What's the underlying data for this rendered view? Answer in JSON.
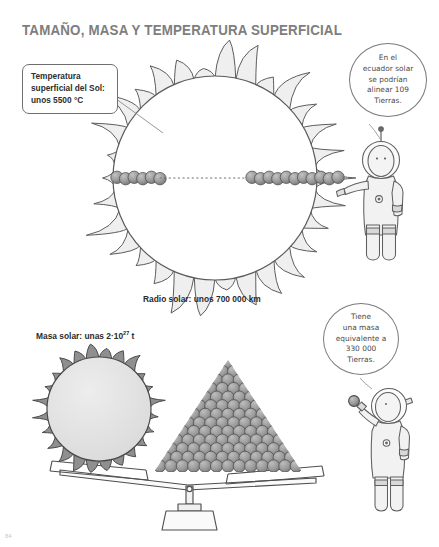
{
  "page": {
    "title": "TAMAÑO, MASA Y TEMPERATURA SUPERFICIAL",
    "page_number": "84",
    "background": "#ffffff",
    "ink": "#4a4a4a"
  },
  "callouts": {
    "temperature": {
      "text": "Temperatura\nsuperficial del Sol:\nunos 5500 °C"
    }
  },
  "captions": {
    "radius": "Radio solar: unos 700 000 km",
    "mass_prefix": "Masa solar: unas 2·10",
    "mass_exponent": "27",
    "mass_suffix": " t"
  },
  "bubbles": [
    {
      "id": "equator",
      "text": "En el\necuador solar\nse podrían\nalinear 109\nTierras."
    },
    {
      "id": "mass",
      "text": "Tiene\nuna masa\nequivalente a\n330 000\nTierras."
    }
  ],
  "figures": {
    "big_sun": {
      "name": "large-sun-illustration",
      "corona_fill": "#efefef",
      "corona_stroke": "#5d5d5d",
      "disc_fill": "#ffffff"
    },
    "earth_row": {
      "name": "earth-row-across-sun-equator",
      "count_label": "109",
      "sphere_fill": "#9a9a9a"
    },
    "small_sun": {
      "name": "small-sun-on-balance",
      "corona_fill": "#8f8f8f",
      "disc_fill": "#e3e3e3"
    },
    "earth_pyramid": {
      "name": "earth-pyramid-stack",
      "rows": 13,
      "sphere_fill": "#9c9c9c",
      "count_label": "330 000"
    },
    "balance": {
      "name": "balance-scale",
      "stroke": "#4f4f4f"
    },
    "astronaut_top": {
      "name": "astronaut-pointing"
    },
    "astronaut_bottom": {
      "name": "astronaut-holding-sphere"
    }
  }
}
